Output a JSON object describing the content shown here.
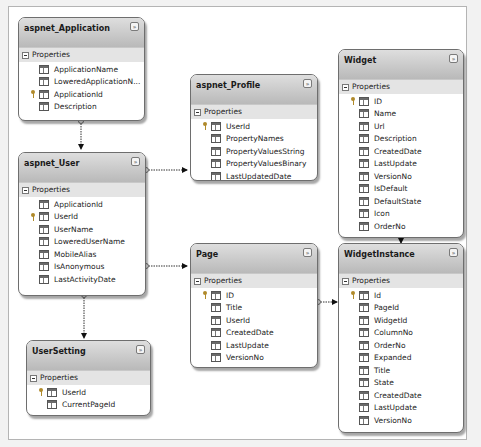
{
  "diagram": {
    "section_label": "Properties",
    "entities": {
      "aspnet_application": {
        "title": "aspnet_Application",
        "props": [
          "ApplicationName",
          "LoweredApplicationN...",
          "ApplicationId",
          "Description"
        ],
        "key": "ApplicationId"
      },
      "aspnet_user": {
        "title": "aspnet_User",
        "props": [
          "ApplicationId",
          "UserId",
          "UserName",
          "LoweredUserName",
          "MobileAlias",
          "IsAnonymous",
          "LastActivityDate"
        ],
        "key": "UserId"
      },
      "aspnet_profile": {
        "title": "aspnet_Profile",
        "props": [
          "UserId",
          "PropertyNames",
          "PropertyValuesString",
          "PropertyValuesBinary",
          "LastUpdatedDate"
        ],
        "key": "UserId"
      },
      "widget": {
        "title": "Widget",
        "props": [
          "ID",
          "Name",
          "Url",
          "Description",
          "CreatedDate",
          "LastUpdate",
          "VersionNo",
          "IsDefault",
          "DefaultState",
          "Icon",
          "OrderNo"
        ],
        "key": "ID"
      },
      "page": {
        "title": "Page",
        "props": [
          "ID",
          "Title",
          "UserId",
          "CreatedDate",
          "LastUpdate",
          "VersionNo"
        ],
        "key": "ID"
      },
      "widget_instance": {
        "title": "WidgetInstance",
        "props": [
          "Id",
          "PageId",
          "WidgetId",
          "ColumnNo",
          "OrderNo",
          "Expanded",
          "Title",
          "State",
          "CreatedDate",
          "LastUpdate",
          "VersionNo"
        ],
        "key": "Id"
      },
      "user_setting": {
        "title": "UserSetting",
        "props": [
          "UserId",
          "CurrentPageId"
        ],
        "key": "UserId"
      }
    },
    "relationships": [
      {
        "from": "aspnet_Application",
        "to": "aspnet_User"
      },
      {
        "from": "aspnet_User",
        "to": "aspnet_Profile"
      },
      {
        "from": "aspnet_User",
        "to": "Page"
      },
      {
        "from": "aspnet_User",
        "to": "UserSetting"
      },
      {
        "from": "Page",
        "to": "WidgetInstance"
      },
      {
        "from": "Widget",
        "to": "WidgetInstance"
      }
    ],
    "collapse_glyph": "»"
  }
}
